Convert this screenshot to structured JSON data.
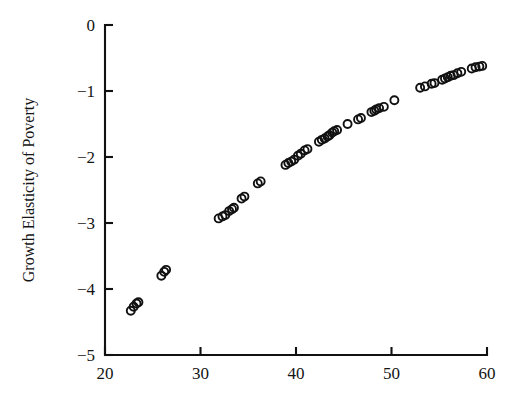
{
  "figure": {
    "background_color": "#ffffff",
    "marker_color": "#111111",
    "axis_color": "#111111",
    "marker_shape": "open-circle"
  },
  "chart_data": {
    "type": "scatter",
    "title": "",
    "subtitle": "",
    "xlabel": "",
    "ylabel": "Growth Elasticity of Poverty",
    "xlim": [
      20,
      60
    ],
    "ylim": [
      -5,
      0
    ],
    "xticks": [
      20,
      30,
      40,
      50,
      60
    ],
    "xtick_labels": [
      "20",
      "30",
      "40",
      "50",
      "60"
    ],
    "yticks": [
      0,
      -1,
      -2,
      -3,
      -4,
      -5
    ],
    "ytick_labels": [
      "0",
      "−1",
      "−2",
      "−3",
      "−4",
      "−5"
    ],
    "grid": false,
    "legend": null,
    "legend_position": "none",
    "annotations": [],
    "series": [
      {
        "name": "countries",
        "marker": "open-circle",
        "points": [
          [
            22.7,
            -4.33
          ],
          [
            23.0,
            -4.27
          ],
          [
            23.3,
            -4.22
          ],
          [
            23.5,
            -4.2
          ],
          [
            25.9,
            -3.8
          ],
          [
            26.2,
            -3.74
          ],
          [
            26.4,
            -3.71
          ],
          [
            31.9,
            -2.93
          ],
          [
            32.3,
            -2.9
          ],
          [
            32.6,
            -2.88
          ],
          [
            33.0,
            -2.82
          ],
          [
            33.3,
            -2.79
          ],
          [
            33.5,
            -2.77
          ],
          [
            34.3,
            -2.63
          ],
          [
            34.6,
            -2.6
          ],
          [
            36.0,
            -2.4
          ],
          [
            36.3,
            -2.37
          ],
          [
            38.9,
            -2.12
          ],
          [
            39.2,
            -2.09
          ],
          [
            39.5,
            -2.07
          ],
          [
            39.8,
            -2.04
          ],
          [
            40.2,
            -1.98
          ],
          [
            40.5,
            -1.95
          ],
          [
            40.9,
            -1.9
          ],
          [
            41.2,
            -1.88
          ],
          [
            42.4,
            -1.77
          ],
          [
            42.7,
            -1.74
          ],
          [
            43.0,
            -1.72
          ],
          [
            43.3,
            -1.69
          ],
          [
            43.5,
            -1.67
          ],
          [
            43.8,
            -1.63
          ],
          [
            44.0,
            -1.61
          ],
          [
            44.3,
            -1.59
          ],
          [
            45.4,
            -1.5
          ],
          [
            46.5,
            -1.43
          ],
          [
            46.8,
            -1.41
          ],
          [
            47.9,
            -1.32
          ],
          [
            48.2,
            -1.3
          ],
          [
            48.4,
            -1.28
          ],
          [
            48.7,
            -1.26
          ],
          [
            49.2,
            -1.24
          ],
          [
            50.3,
            -1.14
          ],
          [
            53.0,
            -0.95
          ],
          [
            53.5,
            -0.93
          ],
          [
            54.2,
            -0.89
          ],
          [
            54.5,
            -0.88
          ],
          [
            55.3,
            -0.83
          ],
          [
            55.6,
            -0.81
          ],
          [
            55.9,
            -0.79
          ],
          [
            56.2,
            -0.77
          ],
          [
            56.5,
            -0.76
          ],
          [
            56.9,
            -0.73
          ],
          [
            57.3,
            -0.71
          ],
          [
            58.4,
            -0.66
          ],
          [
            58.8,
            -0.64
          ],
          [
            59.2,
            -0.63
          ],
          [
            59.5,
            -0.62
          ]
        ]
      }
    ]
  }
}
